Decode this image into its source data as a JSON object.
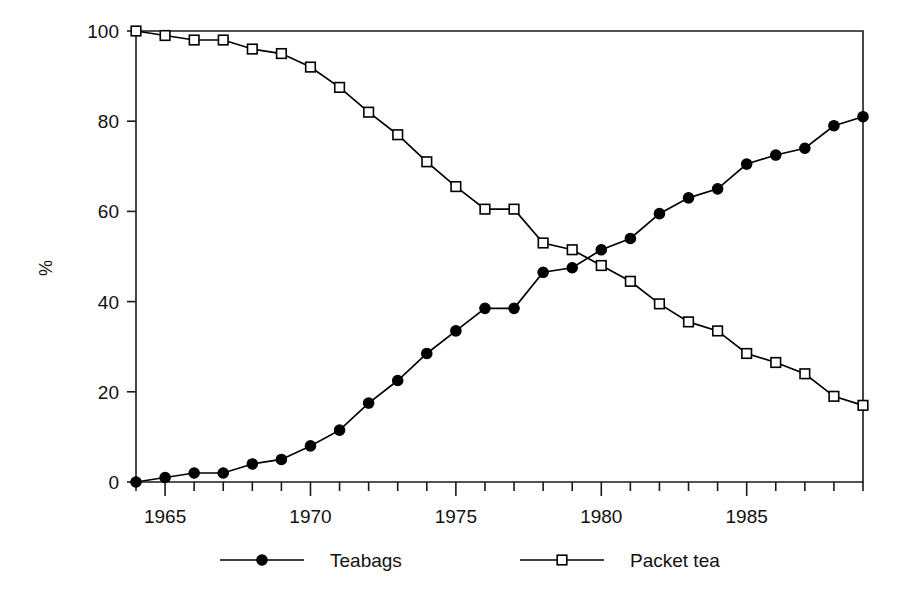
{
  "chart_data": {
    "type": "line",
    "title": "",
    "subtitle": "",
    "xlabel": "",
    "ylabel": "%",
    "xlim": [
      1964,
      1989
    ],
    "ylim": [
      0,
      100
    ],
    "grid": false,
    "legend_position": "bottom",
    "x": [
      1964,
      1965,
      1966,
      1967,
      1968,
      1969,
      1970,
      1971,
      1972,
      1973,
      1974,
      1975,
      1976,
      1977,
      1978,
      1979,
      1980,
      1981,
      1982,
      1983,
      1984,
      1985,
      1986,
      1987,
      1988,
      1989
    ],
    "x_tick_labels": [
      "1965",
      "1970",
      "1975",
      "1980",
      "1985"
    ],
    "x_tick_values": [
      1965,
      1970,
      1975,
      1980,
      1985
    ],
    "y_tick_labels": [
      "0",
      "20",
      "40",
      "60",
      "80",
      "100"
    ],
    "y_tick_values": [
      0,
      20,
      40,
      60,
      80,
      100
    ],
    "series": [
      {
        "name": "Teabags",
        "marker": "filled-circle",
        "values": [
          0,
          1,
          2,
          2,
          4,
          5,
          8,
          11.5,
          17.5,
          22.5,
          28.5,
          33.5,
          38.5,
          38.5,
          46.5,
          47.5,
          51.5,
          54,
          59.5,
          63,
          65,
          70.5,
          72.5,
          74,
          79,
          81
        ]
      },
      {
        "name": "Packet tea",
        "marker": "open-square",
        "values": [
          100,
          99,
          98,
          98,
          96,
          95,
          92,
          87.5,
          82,
          77,
          71,
          65.5,
          60.5,
          60.5,
          53,
          51.5,
          48,
          44.5,
          39.5,
          35.5,
          33.5,
          28.5,
          26.5,
          24,
          19,
          17
        ]
      }
    ]
  },
  "legend": {
    "items": [
      {
        "label": "Teabags",
        "marker": "filled-circle"
      },
      {
        "label": "Packet tea",
        "marker": "open-square"
      }
    ]
  },
  "axes": {
    "y_axis_title": "%"
  }
}
